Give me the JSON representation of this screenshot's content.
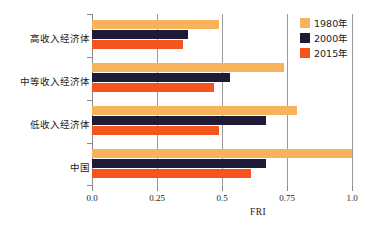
{
  "chart_data": {
    "type": "bar",
    "orientation": "horizontal",
    "title": "",
    "xlabel": "FRI",
    "ylabel": "",
    "xlim": [
      0.0,
      1.0
    ],
    "xticks": [
      "0.0",
      "0.25",
      "0.5",
      "0.75",
      "1.0"
    ],
    "xtick_values": [
      0.0,
      0.25,
      0.5,
      0.75,
      1.0
    ],
    "grid": "vertical",
    "legend_position": "top-right",
    "categories": [
      "高收入经济体",
      "中等收入经济体",
      "低收入经济体",
      "中国"
    ],
    "series": [
      {
        "name": "1980年",
        "color": "#f7b25c",
        "values": [
          0.49,
          0.74,
          0.79,
          1.0
        ]
      },
      {
        "name": "2000年",
        "color": "#1e1b38",
        "values": [
          0.37,
          0.53,
          0.67,
          0.67
        ]
      },
      {
        "name": "2015年",
        "color": "#f4551e",
        "values": [
          0.35,
          0.47,
          0.49,
          0.61
        ]
      }
    ]
  },
  "legend": {
    "items": [
      {
        "label": "1980年",
        "color": "#f7b25c"
      },
      {
        "label": "2000年",
        "color": "#1e1b38"
      },
      {
        "label": "2015年",
        "color": "#f4551e"
      }
    ]
  },
  "axis": {
    "x_title": "FRI"
  }
}
